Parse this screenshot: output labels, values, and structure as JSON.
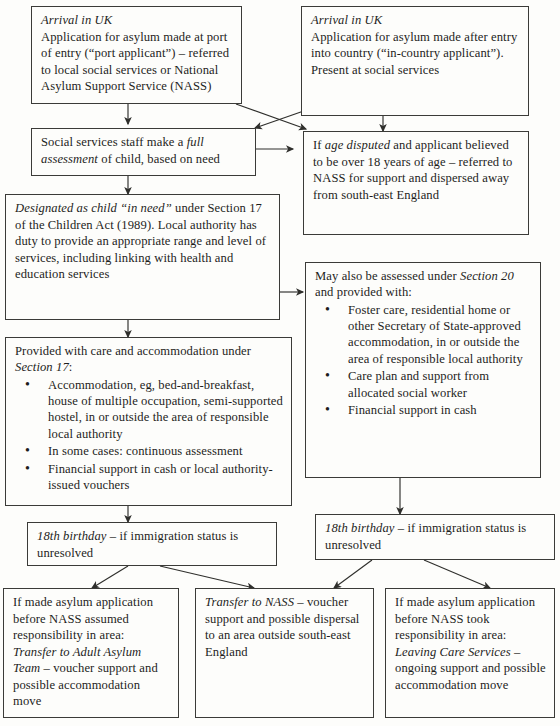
{
  "diagram": {
    "line_color": "#2f2f2c",
    "box_border_color": "#3b3b38",
    "background_color": "#fdfdfb"
  },
  "nodes": {
    "arrival_port": {
      "heading": "Arrival in UK",
      "body": "Application for asylum made at port of entry (“port applicant”) – referred to local social services or National Asylum Support Service (NASS)"
    },
    "arrival_in_country": {
      "heading": "Arrival in UK",
      "body": "Application for asylum made after entry into country (“in-country applicant”). Present at social services"
    },
    "full_assessment": {
      "lead": "Social services staff make a ",
      "emph": "full assessment",
      "tail": " of child, based on need"
    },
    "age_disputed": {
      "lead": "If ",
      "emph": "age disputed",
      "tail": " and applicant believed to be over 18 years of age – referred to NASS for support and dispersed away from south-east England"
    },
    "child_in_need": {
      "emph": "Designated as child “in need”",
      "tail": " under Section 17 of the Children Act (1989). Local authority has duty to provide an appropriate range and level of services, including linking with health and education services"
    },
    "section_17": {
      "lead": "Provided with care and accommodation under ",
      "emph": "Section 17",
      "tail": ":",
      "bullets": [
        "Accommodation, eg, bed-and-breakfast, house of multiple occupation, semi-supported hostel, in or outside the area of responsible local authority",
        "In some cases: continuous assessment",
        "Financial support in cash or local authority-issued vouchers"
      ]
    },
    "section_20": {
      "lead": "May also be assessed under ",
      "emph": "Section 20",
      "tail": " and provided with:",
      "bullets": [
        "Foster care, residential home or other Secretary of State-approved accommodation, in or outside the area of responsible local authority",
        "Care plan and support from allocated social worker",
        "Financial support in cash"
      ]
    },
    "birthday_left": {
      "emph": "18th birthday",
      "tail": " – if immigration status is unresolved"
    },
    "birthday_right": {
      "emph": "18th birthday",
      "tail": " – if immigration status is unresolved"
    },
    "adult_asylum_team": {
      "lead": "If made asylum application before NASS assumed responsibility in area: ",
      "emph": "Transfer to Adult Asylum Team",
      "tail": " – voucher support and possible accommodation move"
    },
    "transfer_nass": {
      "emph": "Transfer to NASS",
      "tail": " – voucher support and possible dispersal to an area outside south-east England"
    },
    "leaving_care": {
      "lead": "If made asylum application before NASS took responsibility in area: ",
      "emph": "Leaving Care Services",
      "tail": " – ongoing support and possible accommodation move"
    }
  }
}
